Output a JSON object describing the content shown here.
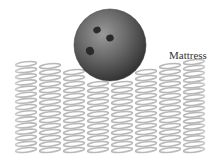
{
  "figure": {
    "label": "Mattress",
    "objects": [
      "bowling-ball",
      "spring-mattress"
    ],
    "ball": {
      "cx": 110,
      "cy": 45,
      "r": 36,
      "color": "#5a5a5a",
      "holes": 3
    },
    "springs": {
      "columns": 8,
      "color": "#b8b8b8",
      "column_tops": [
        64,
        66,
        72,
        84,
        84,
        72,
        66,
        62
      ],
      "bottom": 150,
      "x_start": 14,
      "column_width": 24
    }
  }
}
